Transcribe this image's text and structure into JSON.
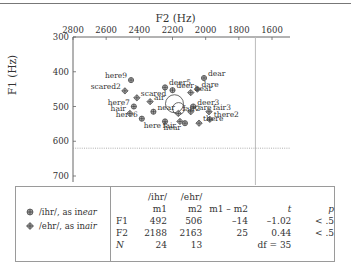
{
  "chart_data": {
    "type": "scatter",
    "title": "",
    "xlabel": "F2 (Hz)",
    "ylabel": "F1 (Hz)",
    "x_axis_position": "top",
    "x_reversed": true,
    "y_reversed": true,
    "xlim": [
      2800,
      1600
    ],
    "ylim": [
      300,
      700
    ],
    "x_ticks": [
      "2800",
      "2600",
      "2400",
      "2200",
      "2000",
      "1800",
      "1600"
    ],
    "y_ticks": [
      "300",
      "400",
      "500",
      "600",
      "700"
    ],
    "reference_lines": [
      {
        "axis": "y",
        "value": 620,
        "style": "dotted"
      },
      {
        "axis": "x",
        "value": 1700,
        "style": "solid-light"
      }
    ],
    "series": [
      {
        "name": "/ihr/, as in ear",
        "marker": "circle-cross",
        "points": [
          {
            "label": "here9",
            "F2": 2450,
            "F1": 424
          },
          {
            "label": "deer5",
            "F2": 2245,
            "F1": 445
          },
          {
            "label": "deer",
            "F2": 2200,
            "F1": 453
          },
          {
            "label": "dear",
            "F2": 2010,
            "F1": 418
          },
          {
            "label": "here7",
            "F2": 2433,
            "F1": 500
          },
          {
            "label": "here6",
            "F2": 2385,
            "F1": 535
          },
          {
            "label": "near",
            "F2": 2315,
            "F1": 515
          },
          {
            "label": "here",
            "F2": 2245,
            "F1": 543
          },
          {
            "label": "deer3",
            "F2": 2075,
            "F1": 500
          },
          {
            "label": "hear",
            "F2": 2125,
            "F1": 548
          }
        ]
      },
      {
        "name": "/ehr/, as in air",
        "marker": "diamond-cross",
        "points": [
          {
            "label": "scared2",
            "F2": 2487,
            "F1": 455
          },
          {
            "label": "scared",
            "F2": 2415,
            "F1": 475
          },
          {
            "label": "hair",
            "F2": 2457,
            "F1": 520
          },
          {
            "label": "air",
            "F2": 2335,
            "F1": 486
          },
          {
            "label": "dare",
            "F2": 2050,
            "F1": 450
          },
          {
            "label": "bear",
            "F2": 2090,
            "F1": 460
          },
          {
            "label": "care",
            "F2": 2090,
            "F1": 515
          },
          {
            "label": "fair3",
            "F2": 1980,
            "F1": 515
          },
          {
            "label": "there2",
            "F2": 1975,
            "F1": 537
          },
          {
            "label": "there",
            "F2": 2040,
            "F1": 548
          },
          {
            "label": "fair",
            "F2": 2155,
            "F1": 543
          },
          {
            "label": "fair2",
            "F2": 2165,
            "F1": 520
          }
        ]
      }
    ],
    "means": [
      {
        "name": "/ihr/ mean",
        "F2": 2188,
        "F1": 492
      },
      {
        "name": "/ehr/ mean",
        "F2": 2163,
        "F1": 506
      }
    ]
  },
  "legend": [
    {
      "symbol": "circle-cross",
      "text": "/ihr/, as in ",
      "word": "ear"
    },
    {
      "symbol": "diamond-cross",
      "text": "/ehr/, as in ",
      "word": "air"
    }
  ],
  "stats_table": {
    "header_row1": [
      "",
      "/ihr/",
      "/ehr/",
      "",
      "",
      ""
    ],
    "header_row2": [
      "",
      "m1",
      "m2",
      "m1 – m2",
      "t",
      "p"
    ],
    "rows": [
      {
        "label": "F1",
        "m1": "492",
        "m2": "506",
        "diff": "–14",
        "t": "–1.02",
        "p": "< .5"
      },
      {
        "label": "F2",
        "m1": "2188",
        "m2": "2163",
        "diff": "25",
        "t": "0.44",
        "p": "< .5"
      },
      {
        "label": "N",
        "m1": "24",
        "m2": "13",
        "diff": "",
        "t": "df = 35",
        "p": ""
      }
    ]
  }
}
